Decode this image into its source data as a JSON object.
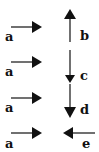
{
  "diagram": {
    "type": "vector-pairs",
    "stroke_color": "#111111",
    "background": "#ffffff",
    "pairs": [
      {
        "reference": {
          "label": "a",
          "direction": "right"
        },
        "compare": {
          "label": "b",
          "direction": "up"
        }
      },
      {
        "reference": {
          "label": "a",
          "direction": "right"
        },
        "compare": {
          "label": "c",
          "direction": "down"
        }
      },
      {
        "reference": {
          "label": "a",
          "direction": "right"
        },
        "compare": {
          "label": "d",
          "direction": "down"
        }
      },
      {
        "reference": {
          "label": "a",
          "direction": "right"
        },
        "compare": {
          "label": "e",
          "direction": "left"
        }
      }
    ]
  }
}
